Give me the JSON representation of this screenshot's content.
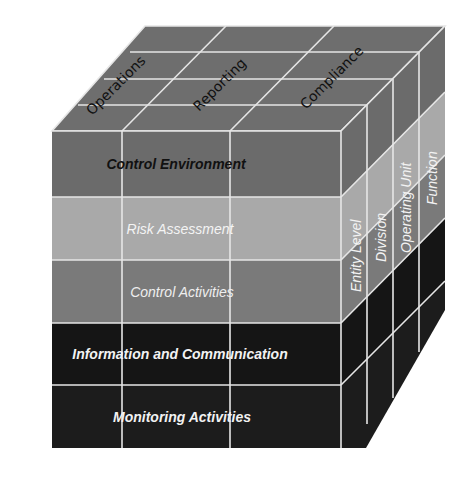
{
  "diagram": {
    "type": "COSO cube",
    "top_face": {
      "labels": [
        "Operations",
        "Reporting",
        "Compliance"
      ],
      "color": "#6e6e6e"
    },
    "front_face": {
      "rows": [
        {
          "label": "Control Environment",
          "fill": "#6b6b6b",
          "text_color": "#111111"
        },
        {
          "label": "Risk Assessment",
          "fill": "#a9a9a9",
          "text_color": "#f4f4f4"
        },
        {
          "label": "Control Activities",
          "fill": "#7a7a7a",
          "text_color": "#eeeeee"
        },
        {
          "label": "Information and Communication",
          "fill": "#151515",
          "text_color": "#f2f2f2"
        },
        {
          "label": "Monitoring Activities",
          "fill": "#1c1c1c",
          "text_color": "#f2f2f2"
        }
      ]
    },
    "right_face": {
      "labels": [
        "Entity Level",
        "Division",
        "Operating Unit",
        "Function"
      ],
      "text_color": "#f2f2f2"
    },
    "grid_color": "#e6e6e6"
  }
}
